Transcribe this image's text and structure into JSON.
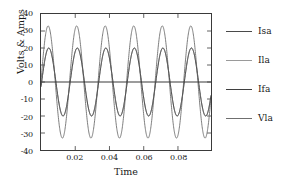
{
  "chart_data": {
    "type": "line",
    "title": "",
    "xlabel": "Time",
    "ylabel": "Volts & Amps",
    "xlim": [
      0,
      0.0993
    ],
    "ylim": [
      -40,
      40
    ],
    "grid": false,
    "legend_position": "right",
    "x_ticks": [
      0.02,
      0.04,
      0.06,
      0.08
    ],
    "x_tick_labels": [
      "0.02",
      "0.04",
      "0.06",
      "0.08"
    ],
    "y_ticks": [
      40,
      30,
      20,
      10,
      0,
      -10,
      -20,
      -30,
      -40
    ],
    "y_tick_labels": [
      "40",
      "30",
      "20",
      "10",
      "0",
      "-10",
      "-20",
      "-30",
      "-40"
    ],
    "frequency_hz": 60,
    "series": [
      {
        "name": "Isa",
        "color": "#4a4a4a",
        "amplitude": 20,
        "phase_deg": -8,
        "description": "source current, 20 A peak sinusoid at 60 Hz"
      },
      {
        "name": "Ila",
        "color": "#8a8a8a",
        "amplitude": 20,
        "phase_deg": -8,
        "description": "load current, overlaps Isa at 20 A peak"
      },
      {
        "name": "Ifa",
        "color": "#3a3a3a",
        "amplitude": 0,
        "phase_deg": 0,
        "description": "filter current, flat line at 0"
      },
      {
        "name": "Vla",
        "color": "#6f6f6f",
        "amplitude": 33,
        "phase_deg": 0,
        "description": "load voltage, 33 V peak sinusoid at 60 Hz"
      }
    ]
  },
  "legend": {
    "items": [
      {
        "label": "Isa",
        "color": "#4a4a4a"
      },
      {
        "label": "Ila",
        "color": "#9a9a9a"
      },
      {
        "label": "Ifa",
        "color": "#3f3f3f"
      },
      {
        "label": "Vla",
        "color": "#6f6f6f"
      }
    ]
  },
  "axes": {
    "y_title": "Volts & Amps",
    "x_title": "Time"
  },
  "colors": {
    "frame": "#3a3a3a",
    "text": "#1a1a1a",
    "background": "#ffffff"
  }
}
